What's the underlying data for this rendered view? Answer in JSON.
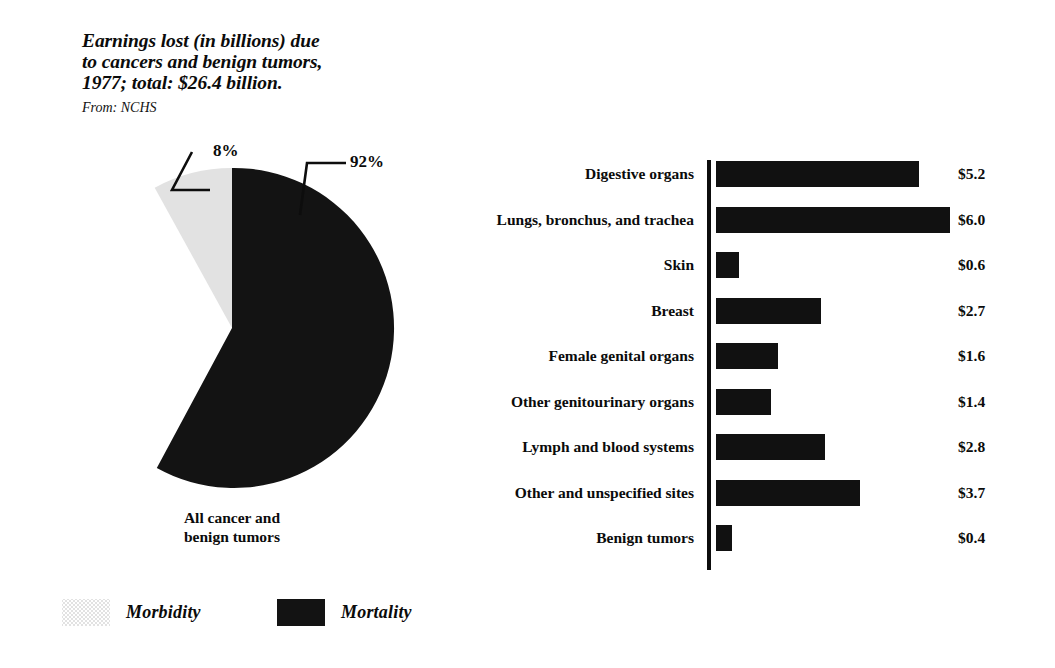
{
  "title": {
    "text": "Earnings lost (in billions) due\nto cancers and benign tumors,\n1977; total: $26.4 billion.",
    "source": "From: NCHS"
  },
  "pie": {
    "caption": "All cancer and\nbenign tumors",
    "labels": {
      "morbidity_pct": "8%",
      "mortality_pct": "92%"
    }
  },
  "legend": {
    "items": [
      {
        "label": "Morbidity",
        "swatch": "light-gray-halftone",
        "color": "#e2e2e2"
      },
      {
        "label": "Mortality",
        "swatch": "solid-black",
        "color": "#131313"
      }
    ]
  },
  "chart_data": [
    {
      "type": "pie",
      "title": "All cancer and benign tumors",
      "labels": [
        "Mortality",
        "Morbidity"
      ],
      "values": [
        92,
        8
      ],
      "value_labels": [
        "92%",
        "8%"
      ],
      "colors": [
        "#131313",
        "#e2e2e2"
      ],
      "units": "percent",
      "legend_position": "bottom-left",
      "annotations": [
        {
          "text": "8%",
          "points_to": "morbidity-wedge"
        },
        {
          "text": "92%",
          "points_to": "mortality-wedge"
        }
      ]
    },
    {
      "type": "bar",
      "orientation": "horizontal",
      "title": "Earnings lost (in billions) due to cancers and benign tumors, 1977",
      "xlabel": "Earnings lost (billions of dollars)",
      "ylabel": "",
      "xlim": [
        0,
        6.2
      ],
      "grid": false,
      "series_color": "#111111",
      "total": 26.4,
      "total_label": "$26.4 billion",
      "categories": [
        "Digestive organs",
        "Lungs, bronchus, and trachea",
        "Skin",
        "Breast",
        "Female genital organs",
        "Other genitourinary organs",
        "Lymph and blood systems",
        "Other and unspecified sites",
        "Benign tumors"
      ],
      "values": [
        5.2,
        6.0,
        0.6,
        2.7,
        1.6,
        1.4,
        2.8,
        3.7,
        0.4
      ],
      "value_labels": [
        "$5.2",
        "$6.0",
        "$0.6",
        "$2.7",
        "$1.6",
        "$1.4",
        "$2.8",
        "$3.7",
        "$0.4"
      ]
    }
  ]
}
